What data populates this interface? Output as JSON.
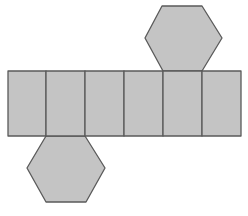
{
  "diagram": {
    "type": "net",
    "colors": {
      "background": "#ffffff",
      "fill": "#c4c4c4",
      "stroke": "#5a5a5a"
    },
    "rectangles": [
      {
        "id": "side-1",
        "x": 8,
        "y": 71,
        "w": 38,
        "h": 65
      },
      {
        "id": "side-2",
        "x": 46,
        "y": 71,
        "w": 39,
        "h": 65
      },
      {
        "id": "side-3",
        "x": 85,
        "y": 71,
        "w": 39,
        "h": 65
      },
      {
        "id": "side-4",
        "x": 124,
        "y": 71,
        "w": 39,
        "h": 65
      },
      {
        "id": "side-5",
        "x": 163,
        "y": 71,
        "w": 39,
        "h": 65
      },
      {
        "id": "side-6",
        "x": 202,
        "y": 71,
        "w": 39,
        "h": 65
      }
    ],
    "hexagons": [
      {
        "id": "top-base",
        "points": "162,6 202,6 222,38 202,71 163,71 145,38"
      },
      {
        "id": "bottom-base",
        "points": "46,136 85,136 105,168 86,202 46,202 27,168"
      }
    ]
  }
}
